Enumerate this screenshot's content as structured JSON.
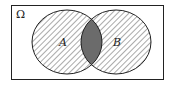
{
  "diagram": {
    "type": "venn",
    "universe_label": "Ω",
    "sets": [
      {
        "name": "A",
        "label": "A",
        "fill": "hatched"
      },
      {
        "name": "B",
        "label": "B",
        "fill": "hatched"
      }
    ],
    "intersection": {
      "sets": [
        "A",
        "B"
      ],
      "fill": "#6b6b6b"
    },
    "colors": {
      "stroke": "#222222",
      "hatch": "#555555",
      "intersection": "#6b6b6b",
      "background": "#ffffff"
    }
  }
}
